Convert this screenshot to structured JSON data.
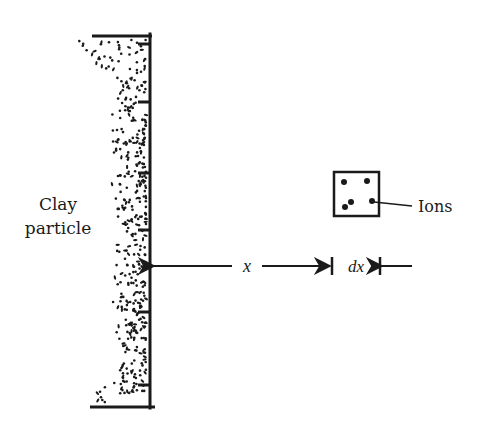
{
  "diagram": {
    "colors": {
      "ink": "#1a1a1a",
      "background": "#ffffff"
    },
    "clay_particle": {
      "label_line1": "Clay",
      "label_line2": "particle",
      "wall_x": 150,
      "wall_top": 34,
      "wall_bottom": 408,
      "top_bar": {
        "x1": 92,
        "x2": 152,
        "y": 36
      },
      "bottom_bar": {
        "x1": 90,
        "x2": 155,
        "y": 407
      },
      "ticks_y": [
        44,
        102,
        173,
        230,
        312,
        385
      ],
      "tick_length": 12
    },
    "ion_element": {
      "label": "Ions",
      "box": {
        "x": 334,
        "y": 172,
        "w": 45,
        "h": 44
      },
      "dots": [
        [
          344,
          182
        ],
        [
          367,
          181
        ],
        [
          345,
          207
        ],
        [
          351,
          202
        ],
        [
          372,
          201
        ]
      ],
      "leader": {
        "x1": 374,
        "y1": 202,
        "x2": 412,
        "y2": 206
      }
    },
    "dimensions": {
      "x_label": "x",
      "dx_label": "dx",
      "arrow_y": 266,
      "x_start": 152,
      "x_end": 331,
      "dx_end": 380
    }
  }
}
